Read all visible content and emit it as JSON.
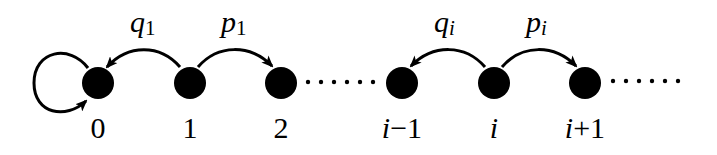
{
  "diagram": {
    "type": "birth-death chain",
    "colors": {
      "node": "#000000",
      "edge": "#000000",
      "background": "#ffffff"
    },
    "nodes": [
      {
        "id": "0",
        "label": "0",
        "cx": 98,
        "cy": 83
      },
      {
        "id": "1",
        "label": "1",
        "cx": 190,
        "cy": 83
      },
      {
        "id": "2",
        "label": "2",
        "cx": 281,
        "cy": 83
      },
      {
        "id": "i-1",
        "label": "i−1",
        "cx": 402,
        "cy": 83
      },
      {
        "id": "i",
        "label": "i",
        "cx": 494,
        "cy": 83
      },
      {
        "id": "i+1",
        "label": "i+1",
        "cx": 585,
        "cy": 83
      }
    ],
    "edges": [
      {
        "from": "0",
        "to": "0",
        "label": "",
        "kind": "self-loop"
      },
      {
        "from": "1",
        "to": "0",
        "label_main": "q",
        "label_sub": "1"
      },
      {
        "from": "1",
        "to": "2",
        "label_main": "p",
        "label_sub": "1"
      },
      {
        "from": "i",
        "to": "i-1",
        "label_main": "q",
        "label_sub": "i"
      },
      {
        "from": "i",
        "to": "i+1",
        "label_main": "p",
        "label_sub": "i"
      }
    ],
    "ellipses": [
      {
        "between": [
          "2",
          "i-1"
        ],
        "dots": 6
      },
      {
        "after": "i+1",
        "dots": 6
      }
    ],
    "labels": {
      "q1_main": "q",
      "q1_sub": "1",
      "p1_main": "p",
      "p1_sub": "1",
      "qi_main": "q",
      "qi_sub": "i",
      "pi_main": "p",
      "pi_sub": "i",
      "n0": "0",
      "n1": "1",
      "n2": "2",
      "n_im1_i": "i",
      "n_im1_rest": "−1",
      "n_i": "i",
      "n_ip1_i": "i",
      "n_ip1_rest": "+1"
    }
  }
}
